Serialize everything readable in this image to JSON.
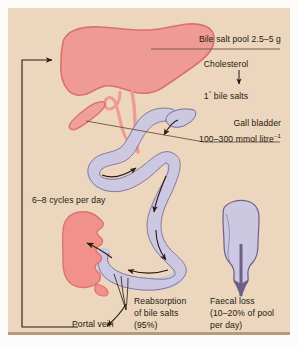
{
  "figure": {
    "background_color": "#ecd6bd",
    "organ_colors": {
      "liver": "#f09a96",
      "liver_stroke": "#d9726e",
      "gall_bladder": "#f0a09a",
      "bile_duct": "#ef9a94",
      "intestine": "#cdc8e2",
      "intestine_stroke": "#6d5f86",
      "portal_organ": "#f2918c",
      "rectum": "#cdc8e2",
      "text": "#231a12",
      "leader_line": "#6b5640"
    }
  },
  "labels": {
    "bile_salt_pool": "Bile salt pool 2.5–5 g",
    "cholesterol": "Cholesterol",
    "primary_bile_salts_prefix": "1",
    "primary_bile_salts_sup": "°",
    "primary_bile_salts_suffix": " bile salts",
    "gall_bladder": "Gall bladder",
    "gall_bladder_conc_prefix": "100–300 mmol litre",
    "gall_bladder_conc_sup": "–1",
    "cycles_per_day": "6–8 cycles per day",
    "reabsorption_line1": "Reabsorption",
    "reabsorption_line2": "of bile  salts",
    "reabsorption_line3": "(95%)",
    "portal_vein": "Portal vein",
    "faecal_loss_line1": "Faecal loss",
    "faecal_loss_line2": "(10–20% of pool",
    "faecal_loss_line3": "per day)"
  },
  "organs": {
    "liver": "liver",
    "gall_bladder": "gall-bladder",
    "bile_duct": "bile-duct",
    "small_intestine": "small-intestine",
    "duodenum": "duodenum",
    "portal_organ": "portal-circulation-organ",
    "rectum": "rectum"
  },
  "arrows": {
    "recycle_to_liver": "recycle-arrow-to-liver",
    "cholesterol_to_bile_salts": "cholesterol-conversion-arrow",
    "intestinal_flow": "intestinal-flow-arrows",
    "reabsorption": "reabsorption-arrow",
    "portal_vein_arrow": "portal-vein-arrow",
    "faecal_loss_arrow": "faecal-loss-arrow"
  }
}
